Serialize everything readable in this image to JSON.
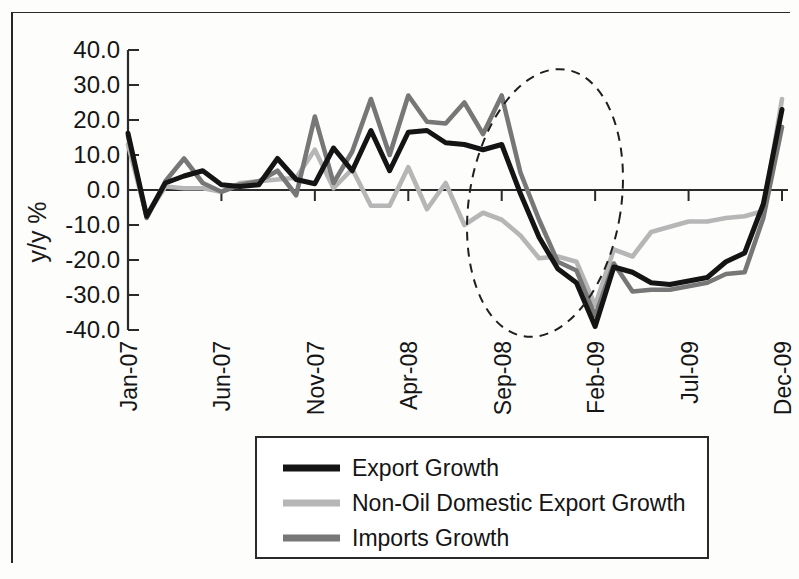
{
  "chart_data": {
    "type": "line",
    "title": "",
    "xlabel": "",
    "ylabel": "y/y %",
    "ylim": [
      -40,
      40
    ],
    "ytick_labels": [
      "40.0",
      "30.0",
      "20.0",
      "10.0",
      "0.0",
      "-10.0",
      "-20.0",
      "-30.0",
      "-40.0"
    ],
    "ytick_values": [
      40,
      30,
      20,
      10,
      0,
      -10,
      -20,
      -30,
      -40
    ],
    "grid": false,
    "legend_position": "bottom-center",
    "x": [
      "Jan-07",
      "Feb-07",
      "Mar-07",
      "Apr-07",
      "May-07",
      "Jun-07",
      "Jul-07",
      "Aug-07",
      "Sep-07",
      "Oct-07",
      "Nov-07",
      "Dec-07",
      "Jan-08",
      "Feb-08",
      "Mar-08",
      "Apr-08",
      "May-08",
      "Jun-08",
      "Jul-08",
      "Aug-08",
      "Sep-08",
      "Oct-08",
      "Nov-08",
      "Dec-08",
      "Jan-09",
      "Feb-09",
      "Mar-09",
      "Apr-09",
      "May-09",
      "Jun-09",
      "Jul-09",
      "Aug-09",
      "Sep-09",
      "Oct-09",
      "Nov-09",
      "Dec-09"
    ],
    "xtick_labels": [
      "Jan-07",
      "Jun-07",
      "Nov-07",
      "Apr-08",
      "Sep-08",
      "Feb-09",
      "Jul-09",
      "Dec-09"
    ],
    "xtick_indices": [
      0,
      5,
      10,
      15,
      20,
      25,
      30,
      35
    ],
    "series": [
      {
        "name": "Export Growth",
        "color": "#141414",
        "values": [
          16.2,
          -7.5,
          2.0,
          4.0,
          5.5,
          1.5,
          1.0,
          1.5,
          9.0,
          3.0,
          1.8,
          12.0,
          5.5,
          17.0,
          5.5,
          16.5,
          17.0,
          13.5,
          13.0,
          11.5,
          13.0,
          -1.0,
          -13.5,
          -22.5,
          -26.5,
          -39.0,
          -22.0,
          -23.5,
          -26.5,
          -27.0,
          -26.0,
          -25.0,
          -20.5,
          -18.0,
          -4.0,
          23.0
        ]
      },
      {
        "name": "Non-Oil Domestic Export Growth",
        "color": "#b6b6b6",
        "values": [
          13.0,
          -7.5,
          1.0,
          0.5,
          0.5,
          -0.5,
          2.0,
          2.5,
          3.0,
          3.5,
          11.5,
          0.5,
          6.0,
          -4.5,
          -4.5,
          6.5,
          -5.5,
          2.0,
          -10.0,
          -6.5,
          -8.5,
          -13.0,
          -19.5,
          -19.0,
          -20.5,
          -33.0,
          -17.0,
          -19.0,
          -12.0,
          -10.5,
          -9.0,
          -9.0,
          -8.0,
          -7.5,
          -6.0,
          26.0
        ]
      },
      {
        "name": "Imports Growth",
        "color": "#777777",
        "values": [
          15.5,
          -8.0,
          2.5,
          9.0,
          2.0,
          -0.5,
          1.5,
          2.5,
          5.5,
          -1.5,
          21.0,
          2.0,
          11.0,
          26.0,
          10.0,
          27.0,
          19.5,
          19.0,
          25.0,
          16.0,
          27.0,
          5.0,
          -8.5,
          -20.5,
          -23.0,
          -36.0,
          -21.0,
          -29.0,
          -28.5,
          -28.5,
          -27.5,
          -26.5,
          -24.0,
          -23.5,
          -8.0,
          18.0
        ]
      }
    ],
    "annotations": [
      {
        "type": "ellipse",
        "style": "dashed",
        "label": "crisis-period-highlight",
        "x_range": [
          "Sep-08",
          "Apr-09"
        ],
        "y_range": [
          -42,
          36
        ]
      }
    ]
  },
  "legend": {
    "items": [
      {
        "label": "Export Growth",
        "color": "#141414"
      },
      {
        "label": "Non-Oil Domestic Export Growth",
        "color": "#b6b6b6"
      },
      {
        "label": "Imports Growth",
        "color": "#777777"
      }
    ]
  }
}
